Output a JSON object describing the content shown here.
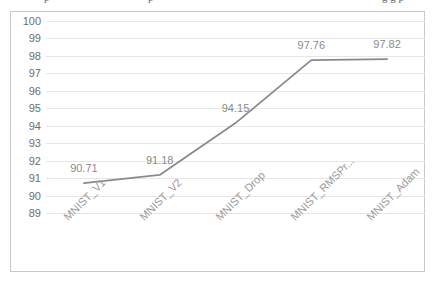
{
  "page": {
    "background_color": "#ffffff",
    "clipped_text_above": {
      "fragment_1": "p",
      "fragment_2": "p",
      "fragment_3": "g g p"
    }
  },
  "chart_frame": {
    "border_color": "#c9c9c9",
    "plot_background": "#ffffff"
  },
  "chart_data": {
    "type": "line",
    "title": "",
    "subtitle": "",
    "xlabel": "",
    "ylabel": "",
    "categories": [
      "MNIST_V1",
      "MNIST_V2",
      "MNIST_Drop",
      "MNIST_RMSPr...",
      "MNIST_Adam"
    ],
    "values": [
      90.71,
      91.18,
      94.15,
      97.76,
      97.82
    ],
    "data_labels": [
      "90.71",
      "91.18",
      "94.15",
      "97.76",
      "97.82"
    ],
    "ylim": [
      89,
      100
    ],
    "ytick_labels": [
      "100",
      "99",
      "98",
      "97",
      "96",
      "95",
      "94",
      "93",
      "92",
      "91",
      "90",
      "89"
    ],
    "ytick_values": [
      100,
      99,
      98,
      97,
      96,
      95,
      94,
      93,
      92,
      91,
      90,
      89
    ],
    "ytick_step": 1,
    "grid": true,
    "grid_axis": "y",
    "grid_color": "#e6e6e6",
    "legend": false,
    "legend_position": "none",
    "series_color": "#8a8a8a",
    "series_line_width": 1.8,
    "markers": false,
    "xtick_rotation_degrees": -45,
    "data_label_color": "#8a8a8a",
    "axis_label_color": "#6e6e6e",
    "category_label_color": "#9a9a9a"
  }
}
